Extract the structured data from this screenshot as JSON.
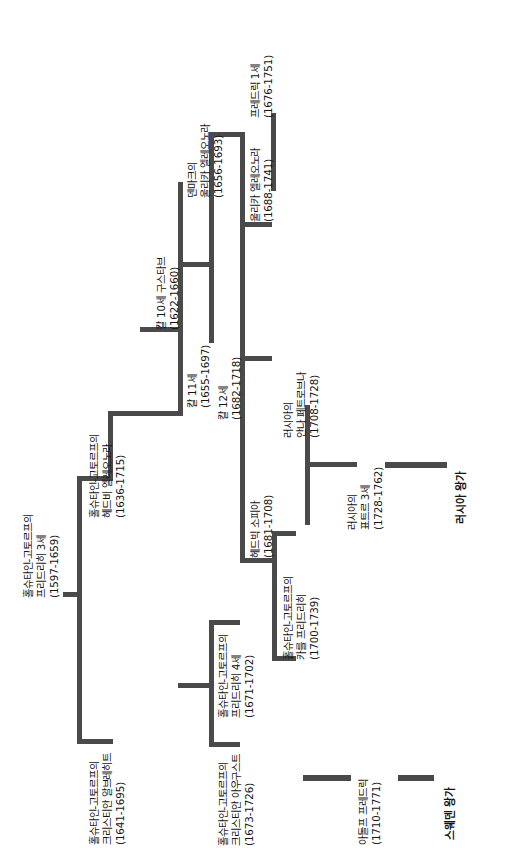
{
  "diagram": {
    "type": "family-tree",
    "orientation": "rotated-90-ccw",
    "line_color": "#4a4a4a",
    "text_color": "#141414",
    "background": "#ffffff",
    "nodes": [
      {
        "id": "frederick3",
        "lines": [
          "홀슈타인-고토르프의",
          "프리드리히 3세",
          "(1597-1659)"
        ],
        "bold": false
      },
      {
        "id": "hedvig-eleonora",
        "lines": [
          "홀슈타인-고토르프의",
          "헤드비 엘레오노라",
          "(1636-1715)"
        ],
        "bold": false
      },
      {
        "id": "christian-albrecht",
        "lines": [
          "홀슈타인-고토르프의",
          "크리스티안 알브레히트",
          "(1641-1695)"
        ],
        "bold": false
      },
      {
        "id": "karl10",
        "lines": [
          "칼 10세 구스타브",
          "(1622-1660)"
        ],
        "bold": false
      },
      {
        "id": "karl11",
        "lines": [
          "칼 11세",
          "(1655-1697)"
        ],
        "bold": false
      },
      {
        "id": "ulrika-eleonora-dk",
        "lines": [
          "덴마크의",
          "울리카 엘레오노라",
          "(1656-1693)"
        ],
        "bold": false
      },
      {
        "id": "frederick1",
        "lines": [
          "프레드릭 1세",
          "(1676-1751)"
        ],
        "bold": false
      },
      {
        "id": "ulrika-eleonora",
        "lines": [
          "울리카 엘레오노라",
          "(1688-1741)"
        ],
        "bold": false
      },
      {
        "id": "karl12",
        "lines": [
          "칼 12세",
          "(1682-1718)"
        ],
        "bold": false
      },
      {
        "id": "hedvig-sophia",
        "lines": [
          "헤드빅 소피아",
          "(1681-1708)"
        ],
        "bold": false
      },
      {
        "id": "karl-friedrich",
        "lines": [
          "홀슈타인-고토르프의",
          "카를 프리드리히",
          "(1700-1739)"
        ],
        "bold": false
      },
      {
        "id": "anna-petrovna",
        "lines": [
          "러시아의",
          "안나 페트로브나",
          "(1708-1728)"
        ],
        "bold": false
      },
      {
        "id": "peter3",
        "lines": [
          "러시아의",
          "표트르 3세",
          "(1728-1762)"
        ],
        "bold": false
      },
      {
        "id": "russian-royal-house",
        "lines": [
          "러시아 왕가"
        ],
        "bold": true
      },
      {
        "id": "frederick4",
        "lines": [
          "홀슈타인-고토르프의",
          "프리드리히 4세",
          "(1671-1702)"
        ],
        "bold": false
      },
      {
        "id": "christian-august",
        "lines": [
          "홀슈타인-고토르프의",
          "크리스티안 아우구스트",
          "(1673-1726)"
        ],
        "bold": false
      },
      {
        "id": "adolf-frederick",
        "lines": [
          "아돌프 프레드릭",
          "(1710-1771)"
        ],
        "bold": false
      },
      {
        "id": "swedish-royal-house",
        "lines": [
          "스웨덴 왕가"
        ],
        "bold": true
      }
    ]
  }
}
